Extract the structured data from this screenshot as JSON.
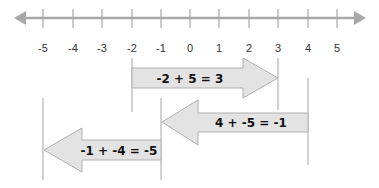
{
  "diagram": {
    "type": "number-line-addition",
    "colors": {
      "axis": "#a8a8a8",
      "tick": "#a8a8a8",
      "guide": "#b4b4b4",
      "arrow_fill": "#e3e3e3",
      "arrow_stroke": "#b0b0b0",
      "text": "#111111"
    },
    "number_line": {
      "min": -5,
      "max": 5,
      "ticks": [
        "-5",
        "-4",
        "-3",
        "-2",
        "-1",
        "0",
        "1",
        "2",
        "3",
        "4",
        "5"
      ],
      "arrows_both_ends": true
    },
    "equations": [
      {
        "label": "-2 + 5 = 3",
        "start": -2,
        "change": 5,
        "end": 3,
        "direction": "right"
      },
      {
        "label": "4 + -5 =  -1",
        "start": 4,
        "change": -5,
        "end": -1,
        "direction": "left"
      },
      {
        "label": "-1 + -4 = -5",
        "start": -1,
        "change": -4,
        "end": -5,
        "direction": "left"
      }
    ]
  }
}
